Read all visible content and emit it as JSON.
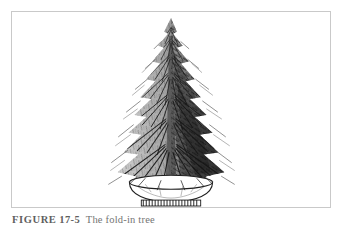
{
  "page": {
    "background_color": "#ffffff",
    "width": 342,
    "height": 225
  },
  "plate": {
    "frame_color": "#c9c9c9",
    "background_color": "#ffffff",
    "illustration": {
      "name": "conifer-tree-in-stand",
      "description": "Pen-and-ink drawing of a tall narrow fir tree with dense drooping needle sprays, shaded dark on the right side, standing in a shallow round basin-style tree stand with a hatched band around the base.",
      "ink_color": "#1b1b1b",
      "shade_color": "#8a8a8a"
    }
  },
  "caption": {
    "label": "FIGURE",
    "number": "17-5",
    "text": "The fold-in tree"
  }
}
